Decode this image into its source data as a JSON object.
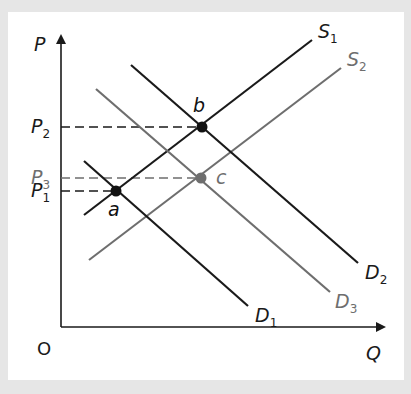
{
  "diagram": {
    "type": "supply-demand",
    "axes": {
      "y_label": "P",
      "x_label": "Q",
      "origin_label": "O"
    },
    "price_levels": [
      {
        "id": "P2",
        "label": "P",
        "sub": "2",
        "y": 127,
        "color": "#1a1a1a"
      },
      {
        "id": "P3",
        "label": "P",
        "sub": "3",
        "y": 178,
        "color": "#6e6e6e"
      },
      {
        "id": "P1",
        "label": "P",
        "sub": "1",
        "y": 191,
        "color": "#1a1a1a"
      }
    ],
    "curves": [
      {
        "id": "S1",
        "label": "S",
        "sub": "1",
        "kind": "supply",
        "color": "#1a1a1a",
        "x1": 84,
        "y1": 215,
        "x2": 312,
        "y2": 40,
        "label_x": 318,
        "label_y": 38
      },
      {
        "id": "S2",
        "label": "S",
        "sub": "2",
        "kind": "supply",
        "color": "#6e6e6e",
        "x1": 89,
        "y1": 260,
        "x2": 341,
        "y2": 68,
        "label_x": 347,
        "label_y": 66
      },
      {
        "id": "D1",
        "label": "D",
        "sub": "1",
        "kind": "demand",
        "color": "#1a1a1a",
        "x1": 84,
        "y1": 161,
        "x2": 248,
        "y2": 306,
        "label_x": 255,
        "label_y": 322
      },
      {
        "id": "D2",
        "label": "D",
        "sub": "2",
        "kind": "demand",
        "color": "#1a1a1a",
        "x1": 131,
        "y1": 65,
        "x2": 358,
        "y2": 263,
        "label_x": 365,
        "label_y": 279
      },
      {
        "id": "D3",
        "label": "D",
        "sub": "3",
        "kind": "demand",
        "color": "#6e6e6e",
        "x1": 96,
        "y1": 89,
        "x2": 330,
        "y2": 292,
        "label_x": 335,
        "label_y": 308
      }
    ],
    "equilibria": [
      {
        "id": "a",
        "label": "a",
        "x": 116,
        "y": 191,
        "color": "#111111",
        "label_x": 108,
        "label_y": 216
      },
      {
        "id": "b",
        "label": "b",
        "x": 202,
        "y": 127,
        "color": "#111111",
        "label_x": 193,
        "label_y": 112
      },
      {
        "id": "c",
        "label": "c",
        "x": 201,
        "y": 178,
        "color": "#6e6e6e",
        "label_x": 216,
        "label_y": 184
      }
    ]
  }
}
